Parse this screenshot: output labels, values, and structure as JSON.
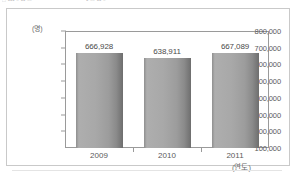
{
  "scan_artifact": {
    "top_line_fragments": [
      "□ ▪▪▪ ▫ ▪▪ ▫▫",
      "▪  ▫▫  ▪▪   ▫"
    ]
  },
  "chart_data": {
    "type": "bar",
    "title": "",
    "categories": [
      "2009",
      "2010",
      "2011"
    ],
    "values": [
      666928,
      638911,
      667089
    ],
    "value_labels": [
      "666,928",
      "638,911",
      "667,089"
    ],
    "xlabel": "(연도)",
    "ylabel": "(명)",
    "ylim": [
      100000,
      800000
    ],
    "y_ticks": [
      800000,
      700000,
      600000,
      500000,
      400000,
      300000,
      200000,
      100000
    ],
    "y_tick_labels": [
      "800,000",
      "700,000",
      "600,000",
      "500,000",
      "400,000",
      "300,000",
      "200,000",
      "100,000"
    ],
    "grid": false,
    "legend": false,
    "series_color": "#a3a3a3",
    "frame_color": "#9a9a9a"
  }
}
